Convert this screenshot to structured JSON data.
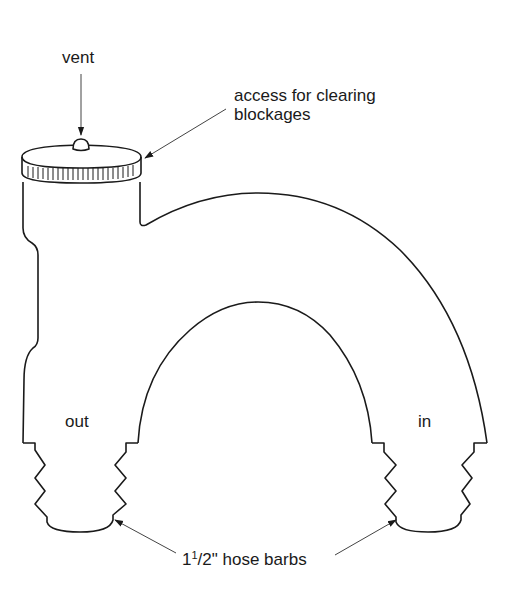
{
  "diagram": {
    "labels": {
      "vent": "vent",
      "access_line1": "access for clearing",
      "access_line2": "blockages",
      "out": "out",
      "in": "in",
      "hose_barbs_whole": "1",
      "hose_barbs_num": "1",
      "hose_barbs_rest": "/2\" hose barbs"
    },
    "colors": {
      "line": "#1a1a1a",
      "leader": "#555555",
      "background": "#ffffff"
    },
    "parts": [
      {
        "name": "vent",
        "type": "bump on cap"
      },
      {
        "name": "access cap",
        "type": "knurled screw cap"
      },
      {
        "name": "out",
        "type": "outlet leg"
      },
      {
        "name": "in",
        "type": "inlet leg"
      },
      {
        "name": "hose barbs",
        "type": "1 1/2 inch barbed fittings",
        "count": 2
      }
    ]
  }
}
